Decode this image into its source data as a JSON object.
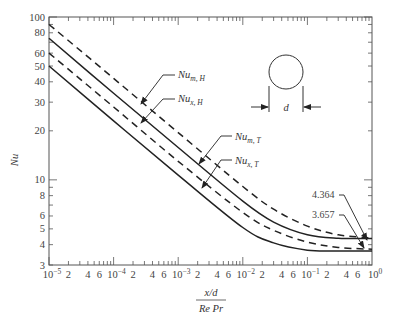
{
  "chart_data": {
    "type": "line",
    "title": "",
    "xlabel_numerator": "x/d",
    "xlabel_denominator": "Re Pr",
    "ylabel": "Nu",
    "xscale": "log",
    "yscale": "log",
    "xlim": [
      1e-05,
      1
    ],
    "ylim": [
      3,
      100
    ],
    "grid": false,
    "x_tick_labels": [
      {
        "v": 1e-05,
        "base": "10",
        "exp": "−5"
      },
      {
        "v": 2e-05,
        "label": "2"
      },
      {
        "v": 4e-05,
        "label": "4"
      },
      {
        "v": 6e-05,
        "label": "6"
      },
      {
        "v": 0.0001,
        "base": "10",
        "exp": "−4"
      },
      {
        "v": 0.0002,
        "label": "2"
      },
      {
        "v": 0.0004,
        "label": "4"
      },
      {
        "v": 0.0006,
        "label": "6"
      },
      {
        "v": 0.001,
        "base": "10",
        "exp": "−3"
      },
      {
        "v": 0.002,
        "label": "2"
      },
      {
        "v": 0.004,
        "label": "4"
      },
      {
        "v": 0.006,
        "label": "6"
      },
      {
        "v": 0.01,
        "base": "10",
        "exp": "−2"
      },
      {
        "v": 0.02,
        "label": "2"
      },
      {
        "v": 0.04,
        "label": "4"
      },
      {
        "v": 0.06,
        "label": "6"
      },
      {
        "v": 0.1,
        "base": "10",
        "exp": "−1"
      },
      {
        "v": 0.2,
        "label": "2"
      },
      {
        "v": 0.4,
        "label": "4"
      },
      {
        "v": 0.6,
        "label": "6"
      },
      {
        "v": 1,
        "base": "10",
        "exp": "0"
      }
    ],
    "y_tick_labels": [
      "3",
      "4",
      "5",
      "6",
      "8",
      "10",
      "20",
      "30",
      "40",
      "50",
      "60",
      "80",
      "100"
    ],
    "y_tick_values": [
      3,
      4,
      5,
      6,
      8,
      10,
      20,
      30,
      40,
      50,
      60,
      80,
      100
    ],
    "series": [
      {
        "name": "Nu_m,H",
        "label_main": "Nu",
        "label_sub": "m, H",
        "style": "dashed",
        "x": [
          1e-05,
          0.0001,
          0.001,
          0.01,
          0.03,
          0.1,
          0.3,
          1
        ],
        "y": [
          90,
          42,
          19.5,
          9.1,
          6.6,
          5.2,
          4.6,
          4.4
        ]
      },
      {
        "name": "Nu_x,H",
        "label_main": "Nu",
        "label_sub": "x, H",
        "style": "solid",
        "x": [
          1e-05,
          0.0001,
          0.001,
          0.01,
          0.03,
          0.1,
          0.3,
          1
        ],
        "y": [
          74,
          34,
          15.8,
          7.4,
          5.5,
          4.6,
          4.38,
          4.364
        ]
      },
      {
        "name": "Nu_m,T",
        "label_main": "Nu",
        "label_sub": "m, T",
        "style": "dashed",
        "x": [
          1e-05,
          0.0001,
          0.001,
          0.01,
          0.03,
          0.1,
          0.3,
          1
        ],
        "y": [
          60,
          28,
          13,
          6.3,
          4.9,
          4.15,
          3.85,
          3.75
        ]
      },
      {
        "name": "Nu_x,T",
        "label_main": "Nu",
        "label_sub": "x, T",
        "style": "solid",
        "x": [
          1e-05,
          0.0001,
          0.001,
          0.01,
          0.03,
          0.1,
          0.3,
          1
        ],
        "y": [
          50,
          23,
          10.7,
          5.1,
          4.1,
          3.7,
          3.66,
          3.657
        ]
      }
    ],
    "annotations": [
      {
        "text": "4.364",
        "points_to": "Nu_x,H asymptote"
      },
      {
        "text": "3.657",
        "points_to": "Nu_x,T asymptote"
      }
    ],
    "inset": {
      "shape": "circle",
      "dimension_label": "d"
    }
  }
}
